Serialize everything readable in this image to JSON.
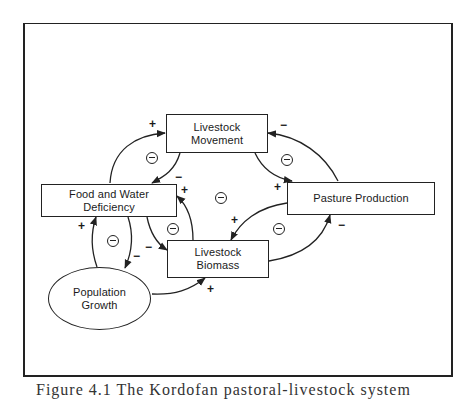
{
  "diagram": {
    "type": "causal-loop",
    "nodes": [
      {
        "id": "livestock_movement",
        "label_lines": [
          "Livestock",
          "Movement"
        ],
        "shape": "rect"
      },
      {
        "id": "food_water_deficiency",
        "label_lines": [
          "Food and Water",
          "Deficiency"
        ],
        "shape": "rect"
      },
      {
        "id": "pasture_production",
        "label_lines": [
          "Pasture Production"
        ],
        "shape": "rect"
      },
      {
        "id": "livestock_biomass",
        "label_lines": [
          "Livestock",
          "Biomass"
        ],
        "shape": "rect"
      },
      {
        "id": "population_growth",
        "label_lines": [
          "Population",
          "Growth"
        ],
        "shape": "ellipse"
      }
    ],
    "edges": [
      {
        "from": "food_water_deficiency",
        "to": "livestock_movement",
        "sign": "+"
      },
      {
        "from": "livestock_movement",
        "to": "food_water_deficiency",
        "sign": "−"
      },
      {
        "from": "livestock_movement",
        "to": "pasture_production",
        "sign": "+"
      },
      {
        "from": "pasture_production",
        "to": "livestock_movement",
        "sign": "−"
      },
      {
        "from": "livestock_biomass",
        "to": "food_water_deficiency",
        "sign": "+"
      },
      {
        "from": "food_water_deficiency",
        "to": "livestock_biomass",
        "sign": "−"
      },
      {
        "from": "pasture_production",
        "to": "livestock_biomass",
        "sign": "+"
      },
      {
        "from": "livestock_biomass",
        "to": "pasture_production",
        "sign": "−"
      },
      {
        "from": "population_growth",
        "to": "food_water_deficiency",
        "sign": "+"
      },
      {
        "from": "food_water_deficiency",
        "to": "population_growth",
        "sign": "−"
      },
      {
        "from": "population_growth",
        "to": "livestock_biomass",
        "sign": "+"
      }
    ],
    "loop_markers": [
      "⊖",
      "⊖",
      "⊖",
      "⊖",
      "⊖",
      "⊖"
    ],
    "signs": {
      "plus": "+",
      "minus": "−"
    }
  },
  "caption": {
    "text": "Figure 4.1   The Kordofan pastoral-livestock system"
  }
}
